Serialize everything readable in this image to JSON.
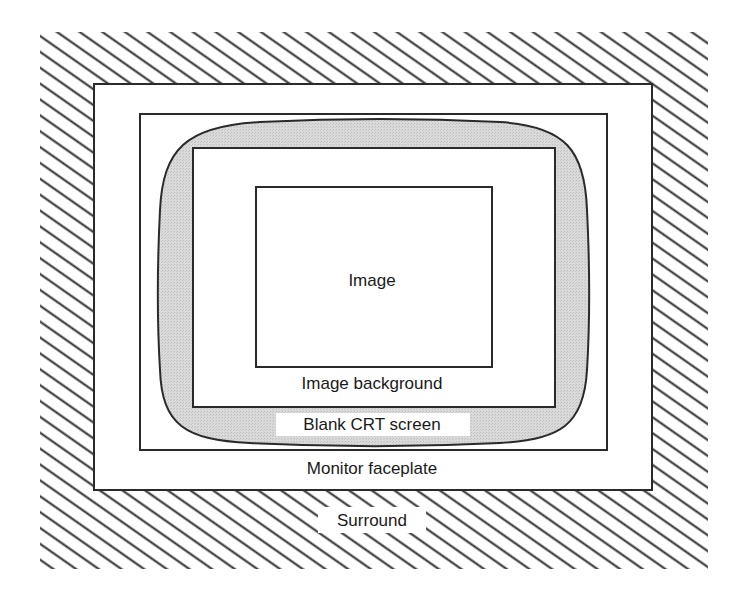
{
  "diagram": {
    "type": "nested-regions",
    "colors": {
      "line": "#2a2a2a",
      "background": "#ffffff",
      "crt_fill": "#d4d4d4",
      "hatch": "#2a2a2a"
    },
    "regions": [
      {
        "id": "surround",
        "label": "Surround",
        "fill": "hatched"
      },
      {
        "id": "monitor-faceplate",
        "label": "Monitor faceplate",
        "fill": "white"
      },
      {
        "id": "blank-crt-screen",
        "label": "Blank CRT screen",
        "fill": "light-gray"
      },
      {
        "id": "image-background",
        "label": "Image background",
        "fill": "white"
      },
      {
        "id": "image",
        "label": "Image",
        "fill": "white"
      }
    ],
    "labels": {
      "surround": "Surround",
      "monitor_faceplate": "Monitor faceplate",
      "blank_crt_screen": "Blank CRT screen",
      "image_background": "Image background",
      "image": "Image"
    }
  }
}
